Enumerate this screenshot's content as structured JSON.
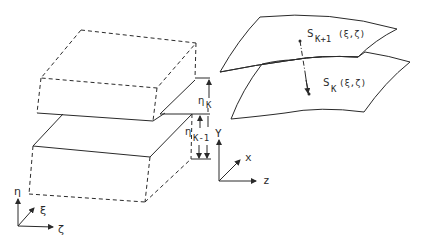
{
  "diagram": {
    "left_panel": {
      "upper_block": {
        "label": "cell layer K"
      },
      "lower_block": {
        "label": "cell layer K-1"
      },
      "dimension_labels": {
        "eta_K": {
          "main": "η",
          "sub": "K"
        },
        "eta_K_minus_1": {
          "main": "η",
          "sub": "K-1"
        }
      },
      "axes": {
        "vertical": "η",
        "diagonal": "ξ",
        "horizontal": "ζ"
      }
    },
    "middle_axes": {
      "vertical": "Y",
      "diagonal": "x",
      "horizontal": "z"
    },
    "right_panel": {
      "upper_surface": {
        "main": "S",
        "sub": "K+1",
        "args": "(ξ,ζ)"
      },
      "lower_surface": {
        "main": "S",
        "sub": "K",
        "args": "(ξ,ζ)"
      }
    },
    "colors": {
      "line": "#2a2a2a",
      "background": "#ffffff"
    }
  }
}
